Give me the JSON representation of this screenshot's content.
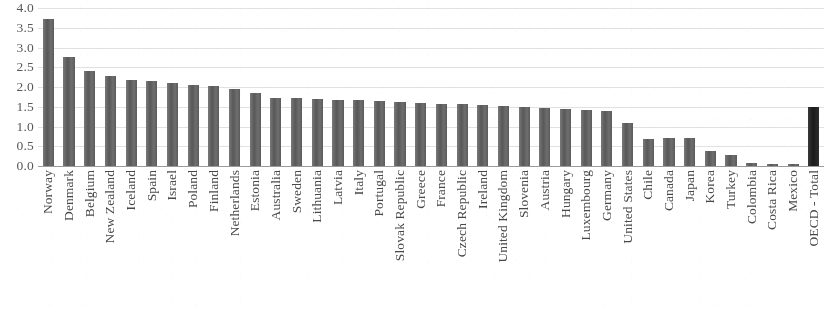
{
  "chart_data": {
    "type": "bar",
    "title": "",
    "subtitle": "",
    "xlabel": "",
    "ylabel": "",
    "ylim": [
      0.0,
      4.0
    ],
    "yticks": [
      "4.0",
      "3.5",
      "3.0",
      "2.5",
      "2.0",
      "1.5",
      "1.0",
      "0.5",
      "0.0"
    ],
    "ytick_values": [
      4.0,
      3.5,
      3.0,
      2.5,
      2.0,
      1.5,
      1.0,
      0.5,
      0.0
    ],
    "grid": "horizontal",
    "legend": "none",
    "legend_position": "none",
    "bar_color": "#5e5e5e",
    "accent_bar_color": "#1f1f1f",
    "accent_category": "OECD - Total",
    "categories": [
      "Norway",
      "Denmark",
      "Belgium",
      "New Zealand",
      "Iceland",
      "Spain",
      "Israel",
      "Poland",
      "Finland",
      "Netherlands",
      "Estonia",
      "Australia",
      "Sweden",
      "Lithuania",
      "Latvia",
      "Italy",
      "Portugal",
      "Slovak Republic",
      "Greece",
      "France",
      "Czech Republic",
      "Ireland",
      "United Kingdom",
      "Slovenia",
      "Austria",
      "Hungary",
      "Luxembourg",
      "Germany",
      "United States",
      "Chile",
      "Canada",
      "Japan",
      "Korea",
      "Turkey",
      "Colombia",
      "Costa Rica",
      "Mexico",
      "OECD - Total"
    ],
    "values": [
      3.72,
      2.75,
      2.4,
      2.28,
      2.18,
      2.15,
      2.1,
      2.06,
      2.03,
      1.95,
      1.85,
      1.73,
      1.72,
      1.7,
      1.68,
      1.66,
      1.65,
      1.62,
      1.6,
      1.58,
      1.56,
      1.55,
      1.52,
      1.5,
      1.48,
      1.45,
      1.42,
      1.4,
      1.08,
      0.68,
      0.72,
      0.72,
      0.38,
      0.28,
      0.08,
      0.06,
      0.05,
      1.5
    ]
  }
}
